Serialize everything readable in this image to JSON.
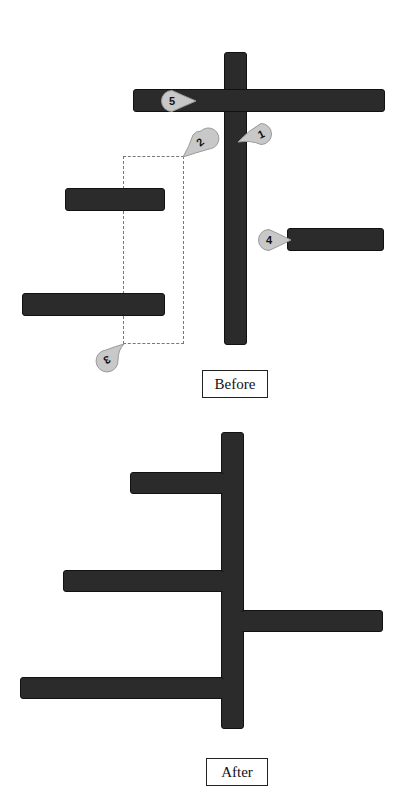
{
  "before": {
    "caption": "Before",
    "vertical_bar": {
      "x": 224,
      "y": 52,
      "w": 23,
      "h": 293
    },
    "horizontal_bars": [
      {
        "id": "top-bar",
        "x": 133,
        "y": 89,
        "w": 252,
        "h": 23
      },
      {
        "id": "left-bar-a",
        "x": 65,
        "y": 188,
        "w": 100,
        "h": 23
      },
      {
        "id": "left-bar-b",
        "x": 22,
        "y": 293,
        "w": 143,
        "h": 23
      },
      {
        "id": "right-bar",
        "x": 287,
        "y": 228,
        "w": 97,
        "h": 23
      }
    ],
    "selection_box": {
      "x": 123,
      "y": 156,
      "w": 61,
      "h": 188
    },
    "callouts": [
      {
        "label": "1",
        "x": 238,
        "y": 124,
        "pointer": "left"
      },
      {
        "label": "2",
        "x": 183,
        "y": 131,
        "pointer": "bottom-left"
      },
      {
        "label": "3",
        "x": 96,
        "y": 344,
        "pointer": "top-right"
      },
      {
        "label": "4",
        "x": 257,
        "y": 228,
        "pointer": "right"
      },
      {
        "label": "5",
        "x": 166,
        "y": 90,
        "pointer": "right"
      }
    ]
  },
  "after": {
    "caption": "After",
    "vertical_bar": {
      "x": 221,
      "y": 432,
      "w": 23,
      "h": 297
    },
    "branches": [
      {
        "id": "branch-left-short",
        "side": "left",
        "x": 130,
        "y": 472,
        "w": 92,
        "h": 22
      },
      {
        "id": "branch-left-mid",
        "side": "left",
        "x": 63,
        "y": 570,
        "w": 159,
        "h": 22
      },
      {
        "id": "branch-right",
        "side": "right",
        "x": 243,
        "y": 610,
        "w": 140,
        "h": 22
      },
      {
        "id": "branch-left-long",
        "side": "left",
        "x": 20,
        "y": 677,
        "w": 202,
        "h": 22
      }
    ]
  },
  "colors": {
    "bar_fill": "#2b2b2b",
    "bar_stroke": "#111111",
    "callout_fill": "#c8c8c8",
    "callout_stroke": "#9a9a9a",
    "dashed_stroke": "#777777"
  }
}
